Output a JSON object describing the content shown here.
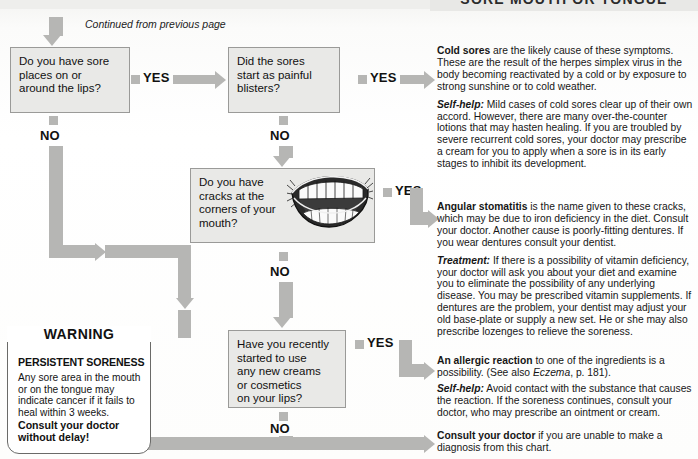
{
  "header": {
    "title": "SORE MOUTH OR TONGUE"
  },
  "flow": {
    "continued_label": "Continued from previous page",
    "yes_label": "YES",
    "no_label": "NO",
    "boxes": [
      {
        "id": "q1",
        "lines": [
          "Do you have sore",
          "places on or",
          "around the lips?"
        ]
      },
      {
        "id": "q2",
        "lines": [
          "Did the sores",
          "start as painful",
          "blisters?"
        ]
      },
      {
        "id": "q3",
        "lines": [
          "Do you have",
          "cracks at the",
          "corners of your",
          "mouth?"
        ]
      },
      {
        "id": "q4",
        "lines": [
          "Have you recently",
          "started to use",
          "any new creams",
          "or cosmetics",
          "on your lips?"
        ]
      }
    ]
  },
  "warning": {
    "title": "WARNING",
    "subtitle": "PERSISTENT SORENESS",
    "body": "Any sore area in the mouth or on the tongue may indicate cancer if it fails to heal within 3 weeks.",
    "cta_line1": "Consult your doctor",
    "cta_line2": "without delay!"
  },
  "answers": {
    "cold_sores": {
      "lead": "Cold sores",
      "lead_rest": " are the likely cause of these symptoms. These are the result of the herpes simplex virus in the body becoming reactivated by a cold or by exposure to strong sunshine or to cold weather.",
      "selfhelp_label": "Self-help:",
      "selfhelp_text": " Mild cases of cold sores clear up of their own accord. However, there are many over-the-counter lotions that may hasten healing. If you are troubled by severe recurrent cold sores, your doctor may prescribe a cream for you to apply when a sore is in its early stages to inhibit its development."
    },
    "angular_stomatitis": {
      "lead": "Angular stomatitis",
      "lead_rest": " is the name given to these cracks, which may be due to iron deficiency in the diet. Consult your doctor. Another cause is poorly-fitting dentures. If you wear dentures consult your dentist.",
      "treatment_label": "Treatment:",
      "treatment_text": " If there is a possibility of vitamin deficiency, your doctor will ask you about your diet and examine you to eliminate the possibility of any underlying disease. You may be prescribed vitamin supplements. If dentures are the problem, your dentist may adjust your old base-plate or supply a new set. He or she may also prescribe lozenges to relieve the soreness."
    },
    "allergic_reaction": {
      "lead": "An allergic reaction",
      "lead_rest": " to one of the ingredients is a possibility. (See also ",
      "cross_ref": "Eczema",
      "cross_ref_rest": ", p. 181).",
      "selfhelp_label": "Self-help:",
      "selfhelp_text": " Avoid contact with the substance that causes the reaction. If the soreness continues, consult your doctor, who may prescribe an ointment or cream."
    },
    "fallback": {
      "lead": "Consult your doctor",
      "lead_rest": " if you are unable to make a diagnosis from this chart."
    }
  },
  "colors": {
    "connector": "#b6b6b4",
    "box_fill": "#e9e9e7",
    "box_border": "#9a9a98",
    "text": "#161616",
    "header_bg": "#e8e8e6"
  }
}
